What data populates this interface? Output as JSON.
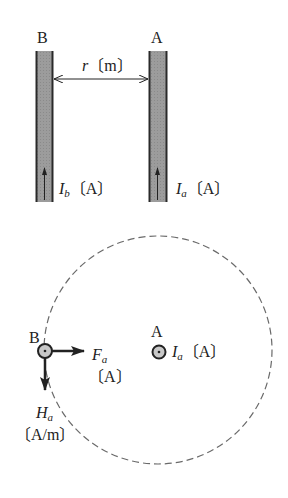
{
  "colors": {
    "conductor_fill": "#9a9a9a",
    "conductor_edge": "#2a2a2a",
    "ink": "#222222",
    "dashed": "#6a6a6a",
    "dot_fill": "#c8c8c8"
  },
  "top_figure": {
    "conductor_b_label": "B",
    "conductor_a_label": "A",
    "distance": {
      "symbol": "r",
      "unit": "〔m〕"
    },
    "current_b": {
      "symbol": "I",
      "subscript": "b",
      "unit": "〔A〕"
    },
    "current_a": {
      "symbol": "I",
      "subscript": "a",
      "unit": "〔A〕"
    }
  },
  "bottom_figure": {
    "point_b_label": "B",
    "point_a_label": "A",
    "current_a": {
      "symbol": "I",
      "subscript": "a",
      "unit": "〔A〕"
    },
    "force": {
      "symbol": "F",
      "subscript": "a",
      "unit": "〔A〕"
    },
    "field": {
      "symbol": "H",
      "subscript": "a",
      "unit": "〔A/m〕"
    }
  }
}
